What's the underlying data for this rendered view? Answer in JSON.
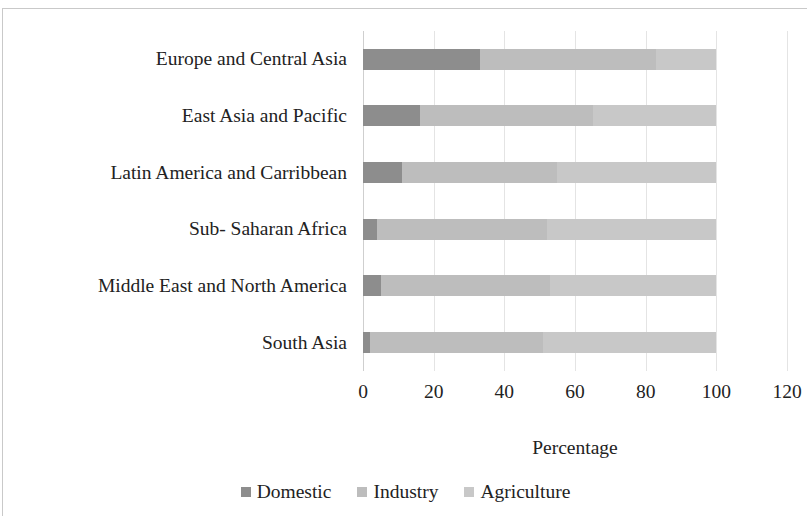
{
  "chart_data": {
    "type": "bar",
    "orientation": "horizontal",
    "stacked": true,
    "stack_mode": "percent",
    "title": "",
    "xlabel": "Percentage",
    "ylabel": "",
    "xlim": [
      0,
      120
    ],
    "xticks": [
      0,
      20,
      40,
      60,
      80,
      100,
      120
    ],
    "xtick_labels": [
      "0",
      "20",
      "40",
      "60",
      "80",
      "100",
      "120"
    ],
    "grid": true,
    "grid_axis": "x",
    "legend_position": "bottom",
    "categories": [
      "Europe and Central Asia",
      "East Asia and Pacific",
      "Latin America and Carribbean",
      "Sub- Saharan Africa",
      "Middle East and North America",
      "South Asia"
    ],
    "series": [
      {
        "name": "Domestic",
        "color": "#8d8d8d",
        "values": [
          33,
          16,
          11,
          4,
          5,
          2
        ]
      },
      {
        "name": "Industry",
        "color": "#bdbdbd",
        "values": [
          50,
          49,
          44,
          48,
          48,
          49
        ]
      },
      {
        "name": "Agriculture",
        "color": "#c8c8c8",
        "values": [
          17,
          35,
          45,
          48,
          47,
          49
        ]
      }
    ]
  },
  "axis": {
    "x_title": "Percentage"
  },
  "legend": {
    "items": [
      {
        "label": "Domestic",
        "color": "#8d8d8d"
      },
      {
        "label": "Industry",
        "color": "#bdbdbd"
      },
      {
        "label": "Agriculture",
        "color": "#c8c8c8"
      }
    ]
  }
}
